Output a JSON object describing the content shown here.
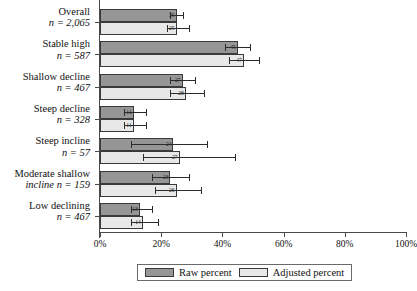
{
  "chart_data": {
    "type": "bar",
    "orientation": "horizontal",
    "title": "",
    "xlabel": "",
    "ylabel": "",
    "xlim": [
      0,
      100
    ],
    "xticks": [
      0,
      20,
      40,
      60,
      80,
      100
    ],
    "xticklabels": [
      "0%",
      "20%",
      "40%",
      "60%",
      "80%",
      "100%"
    ],
    "grid": false,
    "legend_position": "bottom",
    "categories": [
      {
        "name": "Overall",
        "n_label": "n = 2,065",
        "wrap": false
      },
      {
        "name": "Stable high",
        "n_label": "n = 587",
        "wrap": false
      },
      {
        "name": "Shallow decline",
        "n_label": "n = 467",
        "wrap": false
      },
      {
        "name": "Steep decline",
        "n_label": "n = 328",
        "wrap": false
      },
      {
        "name": "Steep incline",
        "n_label": "n = 57",
        "wrap": false
      },
      {
        "name": "Moderate shallow",
        "n_label": "incline n = 159",
        "wrap": true
      },
      {
        "name": "Low declining",
        "n_label": "n = 467",
        "wrap": false
      }
    ],
    "series": [
      {
        "name": "Raw percent",
        "color": "#969696",
        "values": [
          25,
          45,
          27,
          11,
          24,
          23,
          13
        ],
        "value_labels": [
          "25",
          "45",
          "27",
          "11",
          "24",
          "23",
          "13"
        ],
        "ci_low": [
          23,
          41,
          23,
          8,
          10,
          17,
          10
        ],
        "ci_high": [
          27,
          49,
          31,
          15,
          35,
          29,
          17
        ]
      },
      {
        "name": "Adjusted percent",
        "color": "#e8e8e8",
        "values": [
          25,
          47,
          28,
          11,
          26,
          25,
          14
        ],
        "value_labels": [
          "25",
          "47",
          "28",
          "11",
          "27",
          "26",
          "14"
        ],
        "ci_low": [
          22,
          42,
          23,
          8,
          14,
          18,
          10
        ],
        "ci_high": [
          29,
          52,
          34,
          15,
          44,
          33,
          19
        ]
      }
    ]
  },
  "legend": {
    "raw_label": "Raw percent",
    "adjusted_label": "Adjusted percent"
  }
}
